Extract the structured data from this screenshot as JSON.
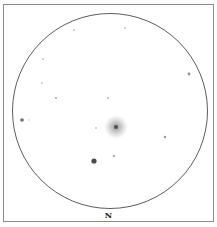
{
  "sketch": {
    "orientation_label": "N",
    "field_circle": {
      "cx": 110,
      "cy": 111,
      "r": 97.5,
      "stroke": "#4a4a4a"
    },
    "frame_color": "#8a8a8a",
    "galaxy": {
      "cx": 116,
      "cy": 127,
      "halo_r": 13,
      "core_r": 3,
      "halo_color": "#b0b0b0",
      "core_color": "#555555"
    },
    "stars": [
      {
        "x": 74,
        "y": 30,
        "r": 0.9,
        "color": "#bdbdbd"
      },
      {
        "x": 125,
        "y": 28,
        "r": 0.9,
        "color": "#bdbdbd"
      },
      {
        "x": 43,
        "y": 59,
        "r": 0.9,
        "color": "#bdbdbd"
      },
      {
        "x": 42,
        "y": 83,
        "r": 0.9,
        "color": "#c4c4c4"
      },
      {
        "x": 56,
        "y": 98,
        "r": 1.1,
        "color": "#a8a8a8"
      },
      {
        "x": 108,
        "y": 98,
        "r": 1.0,
        "color": "#b0b0b0"
      },
      {
        "x": 189,
        "y": 74,
        "r": 1.4,
        "color": "#8e8e8e"
      },
      {
        "x": 22,
        "y": 120,
        "r": 1.8,
        "color": "#6e6e6e"
      },
      {
        "x": 29,
        "y": 120,
        "r": 0.8,
        "color": "#cfcfcf"
      },
      {
        "x": 96,
        "y": 128,
        "r": 0.9,
        "color": "#c0c0c0"
      },
      {
        "x": 165,
        "y": 137,
        "r": 1.2,
        "color": "#9a9a9a"
      },
      {
        "x": 114,
        "y": 156,
        "r": 1.1,
        "color": "#9c9c9c"
      },
      {
        "x": 94,
        "y": 161,
        "r": 2.6,
        "color": "#4a4a4a"
      }
    ]
  }
}
